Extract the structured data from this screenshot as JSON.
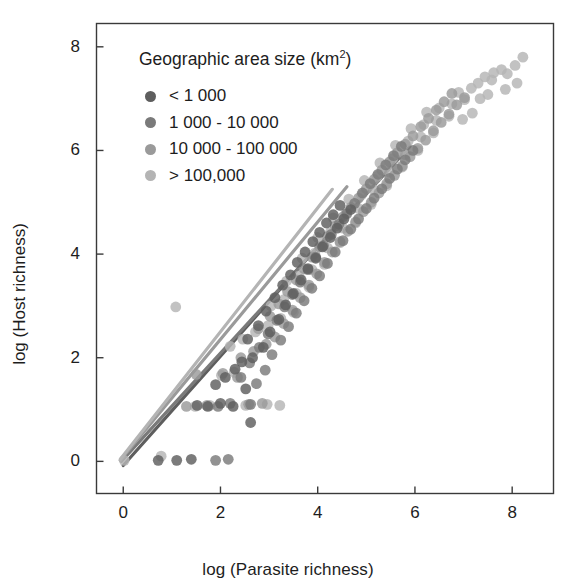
{
  "chart_data": {
    "type": "scatter",
    "title": "",
    "xlabel": "log (Parasite richness)",
    "ylabel": "log (Host richness)",
    "xlim": [
      -0.55,
      8.85
    ],
    "ylim": [
      -0.62,
      8.45
    ],
    "xticks": [
      "0",
      "2",
      "4",
      "6",
      "8"
    ],
    "xtick_values": [
      0,
      2,
      4,
      6,
      8
    ],
    "yticks": [
      "0",
      "2",
      "4",
      "6",
      "8"
    ],
    "ytick_values": [
      0,
      2,
      4,
      6,
      8
    ],
    "grid": false,
    "legend_position": "top-left-inside",
    "legend_title": "Geographic area size (km²)",
    "legend_title_text": "Geographic area size (km",
    "legend_title_sup": "2",
    "legend_title_tail": ")",
    "series": [
      {
        "name": "< 1 000",
        "color": "#5e5e5e",
        "points": [
          [
            0.72,
            0.02
          ],
          [
            1.1,
            0.02
          ],
          [
            1.4,
            0.04
          ],
          [
            2.62,
            0.75
          ],
          [
            1.74,
            1.06
          ],
          [
            2.0,
            1.12
          ],
          [
            2.26,
            1.06
          ],
          [
            1.52,
            1.08
          ],
          [
            2.52,
            1.4
          ],
          [
            2.1,
            1.62
          ],
          [
            1.9,
            1.48
          ],
          [
            2.44,
            1.92
          ],
          [
            2.66,
            2.0
          ],
          [
            2.3,
            1.78
          ],
          [
            2.88,
            2.2
          ],
          [
            2.56,
            2.36
          ],
          [
            3.02,
            2.5
          ],
          [
            2.78,
            2.62
          ],
          [
            3.2,
            2.74
          ],
          [
            2.94,
            2.9
          ],
          [
            3.34,
            3.02
          ],
          [
            3.12,
            3.16
          ],
          [
            3.5,
            3.24
          ],
          [
            3.28,
            3.4
          ],
          [
            3.66,
            3.5
          ],
          [
            3.44,
            3.6
          ],
          [
            3.8,
            3.72
          ],
          [
            3.58,
            3.84
          ],
          [
            3.96,
            3.92
          ],
          [
            3.74,
            4.04
          ],
          [
            4.1,
            4.14
          ],
          [
            3.9,
            4.24
          ],
          [
            4.26,
            4.32
          ],
          [
            4.04,
            4.42
          ],
          [
            4.4,
            4.5
          ],
          [
            4.18,
            4.6
          ],
          [
            4.54,
            4.68
          ],
          [
            4.32,
            4.76
          ],
          [
            4.68,
            4.86
          ],
          [
            4.46,
            4.94
          ]
        ]
      },
      {
        "name": "1 000 - 10 000",
        "color": "#7a7a7a",
        "points": [
          [
            1.9,
            0.02
          ],
          [
            2.16,
            0.04
          ],
          [
            2.62,
            1.1
          ],
          [
            2.2,
            1.12
          ],
          [
            1.95,
            1.06
          ],
          [
            2.74,
            1.5
          ],
          [
            2.42,
            1.62
          ],
          [
            2.92,
            1.76
          ],
          [
            2.6,
            1.9
          ],
          [
            3.06,
            2.06
          ],
          [
            2.8,
            2.2
          ],
          [
            3.24,
            2.34
          ],
          [
            2.98,
            2.46
          ],
          [
            3.4,
            2.6
          ],
          [
            3.16,
            2.72
          ],
          [
            3.56,
            2.86
          ],
          [
            3.32,
            2.98
          ],
          [
            3.72,
            3.1
          ],
          [
            3.48,
            3.22
          ],
          [
            3.88,
            3.34
          ],
          [
            3.64,
            3.46
          ],
          [
            4.04,
            3.58
          ],
          [
            3.8,
            3.7
          ],
          [
            4.2,
            3.82
          ],
          [
            3.96,
            3.94
          ],
          [
            4.36,
            4.04
          ],
          [
            4.12,
            4.16
          ],
          [
            4.52,
            4.26
          ],
          [
            4.28,
            4.38
          ],
          [
            4.68,
            4.48
          ],
          [
            4.44,
            4.58
          ],
          [
            4.84,
            4.68
          ],
          [
            4.6,
            4.78
          ],
          [
            5.0,
            4.88
          ],
          [
            4.76,
            4.98
          ],
          [
            5.16,
            5.08
          ],
          [
            4.92,
            5.18
          ],
          [
            5.32,
            5.26
          ],
          [
            5.08,
            5.36
          ],
          [
            5.48,
            5.46
          ],
          [
            5.24,
            5.54
          ],
          [
            5.64,
            5.64
          ],
          [
            5.4,
            5.72
          ],
          [
            5.8,
            5.82
          ],
          [
            5.56,
            5.9
          ],
          [
            5.96,
            6.0
          ],
          [
            5.72,
            6.08
          ]
        ]
      },
      {
        "name": "10 000 - 100 000",
        "color": "#9a9a9a",
        "points": [
          [
            1.3,
            1.06
          ],
          [
            1.72,
            1.08
          ],
          [
            1.5,
            1.68
          ],
          [
            2.05,
            1.7
          ],
          [
            2.35,
            1.62
          ],
          [
            2.58,
            1.1
          ],
          [
            2.86,
            1.12
          ],
          [
            2.42,
            2.0
          ],
          [
            2.68,
            2.12
          ],
          [
            2.94,
            2.26
          ],
          [
            3.12,
            2.4
          ],
          [
            2.78,
            2.56
          ],
          [
            3.3,
            2.66
          ],
          [
            3.02,
            2.8
          ],
          [
            3.48,
            2.92
          ],
          [
            3.2,
            3.04
          ],
          [
            3.64,
            3.16
          ],
          [
            3.38,
            3.28
          ],
          [
            3.82,
            3.4
          ],
          [
            3.56,
            3.5
          ],
          [
            3.98,
            3.62
          ],
          [
            3.72,
            3.72
          ],
          [
            4.14,
            3.84
          ],
          [
            3.88,
            3.94
          ],
          [
            4.3,
            4.04
          ],
          [
            4.04,
            4.14
          ],
          [
            4.46,
            4.24
          ],
          [
            4.2,
            4.34
          ],
          [
            4.62,
            4.44
          ],
          [
            4.36,
            4.54
          ],
          [
            4.78,
            4.62
          ],
          [
            4.52,
            4.72
          ],
          [
            4.94,
            4.82
          ],
          [
            4.68,
            4.9
          ],
          [
            5.1,
            5.0
          ],
          [
            4.84,
            5.08
          ],
          [
            5.26,
            5.18
          ],
          [
            5.0,
            5.26
          ],
          [
            5.42,
            5.36
          ],
          [
            5.16,
            5.44
          ],
          [
            5.58,
            5.52
          ],
          [
            5.32,
            5.62
          ],
          [
            5.74,
            5.7
          ],
          [
            5.48,
            5.78
          ],
          [
            5.9,
            5.88
          ],
          [
            5.64,
            5.96
          ],
          [
            6.06,
            6.04
          ],
          [
            5.8,
            6.12
          ],
          [
            6.22,
            6.2
          ],
          [
            5.96,
            6.28
          ],
          [
            6.38,
            6.38
          ],
          [
            6.12,
            6.46
          ],
          [
            6.54,
            6.54
          ],
          [
            6.28,
            6.62
          ],
          [
            6.7,
            6.7
          ],
          [
            6.44,
            6.78
          ],
          [
            6.86,
            6.88
          ],
          [
            6.6,
            6.94
          ],
          [
            7.02,
            7.02
          ],
          [
            6.76,
            7.1
          ]
        ]
      },
      {
        "name": "> 100,000",
        "color": "#b4b4b4",
        "points": [
          [
            0.02,
            0.02
          ],
          [
            0.78,
            0.1
          ],
          [
            1.08,
            2.98
          ],
          [
            1.48,
            1.06
          ],
          [
            1.78,
            1.08
          ],
          [
            2.02,
            1.66
          ],
          [
            2.28,
            1.72
          ],
          [
            2.52,
            1.08
          ],
          [
            2.96,
            1.1
          ],
          [
            3.22,
            1.08
          ],
          [
            2.2,
            2.22
          ],
          [
            2.46,
            2.36
          ],
          [
            2.72,
            2.5
          ],
          [
            2.98,
            2.62
          ],
          [
            3.24,
            2.76
          ],
          [
            3.5,
            2.88
          ],
          [
            3.04,
            3.0
          ],
          [
            3.3,
            3.12
          ],
          [
            3.56,
            3.24
          ],
          [
            3.82,
            3.36
          ],
          [
            3.36,
            3.48
          ],
          [
            3.62,
            3.58
          ],
          [
            3.88,
            3.7
          ],
          [
            4.14,
            3.8
          ],
          [
            3.68,
            3.92
          ],
          [
            3.94,
            4.02
          ],
          [
            4.2,
            4.12
          ],
          [
            4.46,
            4.22
          ],
          [
            4.0,
            4.32
          ],
          [
            4.26,
            4.42
          ],
          [
            4.52,
            4.5
          ],
          [
            4.78,
            4.6
          ],
          [
            4.32,
            4.7
          ],
          [
            4.58,
            4.78
          ],
          [
            4.84,
            4.88
          ],
          [
            5.1,
            4.96
          ],
          [
            4.64,
            5.06
          ],
          [
            4.9,
            5.14
          ],
          [
            5.16,
            5.24
          ],
          [
            5.42,
            5.32
          ],
          [
            4.96,
            5.42
          ],
          [
            5.22,
            5.5
          ],
          [
            5.48,
            5.58
          ],
          [
            5.74,
            5.68
          ],
          [
            5.28,
            5.76
          ],
          [
            5.54,
            5.84
          ],
          [
            5.8,
            5.92
          ],
          [
            6.06,
            6.0
          ],
          [
            5.6,
            6.1
          ],
          [
            5.86,
            6.18
          ],
          [
            6.12,
            6.26
          ],
          [
            6.38,
            6.34
          ],
          [
            5.92,
            6.42
          ],
          [
            6.18,
            6.5
          ],
          [
            6.44,
            6.58
          ],
          [
            6.7,
            6.66
          ],
          [
            6.24,
            6.74
          ],
          [
            6.5,
            6.82
          ],
          [
            6.76,
            6.9
          ],
          [
            7.02,
            6.98
          ],
          [
            6.9,
            7.12
          ],
          [
            7.16,
            7.2
          ],
          [
            7.3,
            7.3
          ],
          [
            7.44,
            7.42
          ],
          [
            7.58,
            7.36
          ],
          [
            7.62,
            7.5
          ],
          [
            7.78,
            7.56
          ],
          [
            7.9,
            7.48
          ],
          [
            8.06,
            7.64
          ],
          [
            8.22,
            7.8
          ],
          [
            8.1,
            7.3
          ],
          [
            7.86,
            7.18
          ],
          [
            7.34,
            7.0
          ],
          [
            7.5,
            7.08
          ],
          [
            6.98,
            6.6
          ],
          [
            7.18,
            6.72
          ]
        ]
      }
    ],
    "regression_lines": [
      {
        "name": "< 1 000",
        "color": "#5e5e5e",
        "x0": 0.0,
        "y0": -0.08,
        "x1": 4.72,
        "y1": 4.9
      },
      {
        "name": "1 000 - 10 000",
        "color": "#7a7a7a",
        "x0": -0.04,
        "y0": 0.0,
        "x1": 5.9,
        "y1": 6.08
      },
      {
        "name": "10 000 - 100 000",
        "color": "#9a9a9a",
        "x0": -0.06,
        "y0": 0.02,
        "x1": 4.6,
        "y1": 5.3
      },
      {
        "name": "> 100,000",
        "color": "#b4b4b4",
        "x0": -0.06,
        "y0": 0.04,
        "x1": 4.3,
        "y1": 5.25
      }
    ]
  },
  "legend": {
    "title": "Geographic area size (km²)",
    "items": [
      {
        "label": "< 1 000",
        "color": "#5e5e5e"
      },
      {
        "label": "1 000 - 10 000",
        "color": "#7a7a7a"
      },
      {
        "label": "10 000 - 100 000",
        "color": "#9a9a9a"
      },
      {
        "label": "> 100,000",
        "color": "#b4b4b4"
      }
    ]
  },
  "axes": {
    "x_label": "log (Parasite richness)",
    "y_label": "log (Host richness)",
    "frame_color": "#3a3a3a"
  }
}
